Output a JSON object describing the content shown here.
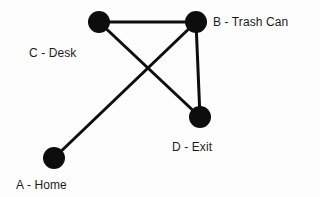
{
  "diagram": {
    "type": "undirected-graph",
    "title": "",
    "background_color": "#fdfdfd",
    "node_color": "#0d0d0d",
    "edge_color": "#0d0d0d",
    "label_color": "#1c1c1c",
    "node_radius": 11,
    "edge_width": 3,
    "nodes": [
      {
        "id": "A",
        "label": "A - Home",
        "cx": 54,
        "cy": 158,
        "label_x": 16,
        "label_y": 179
      },
      {
        "id": "B",
        "label": "B - Trash Can",
        "cx": 196,
        "cy": 22,
        "label_x": 213,
        "label_y": 16
      },
      {
        "id": "C",
        "label": "C - Desk",
        "cx": 99,
        "cy": 22,
        "label_x": 29,
        "label_y": 47
      },
      {
        "id": "D",
        "label": "D - Exit",
        "cx": 200,
        "cy": 117,
        "label_x": 172,
        "label_y": 141
      }
    ],
    "edges": [
      {
        "from": "C",
        "to": "B"
      },
      {
        "from": "B",
        "to": "D"
      },
      {
        "from": "C",
        "to": "D"
      },
      {
        "from": "A",
        "to": "B"
      }
    ]
  }
}
